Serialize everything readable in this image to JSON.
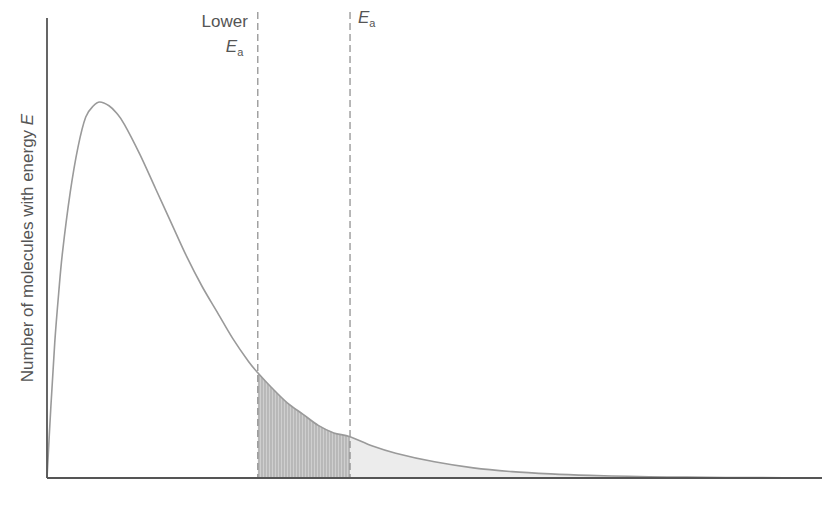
{
  "chart_data": {
    "type": "area",
    "title": "",
    "xlabel": "",
    "ylabel": "Number of molecules with energy",
    "ylabel_var": "E",
    "xlim": [
      0,
      10
    ],
    "ylim": [
      0,
      1.25
    ],
    "grid": false,
    "legend": "none",
    "series": [
      {
        "name": "energy distribution",
        "color": "#9a9a9a",
        "x": [
          0,
          0.05,
          0.1,
          0.15,
          0.2,
          0.3,
          0.4,
          0.5,
          0.6,
          0.68,
          0.8,
          0.9,
          1.0,
          1.2,
          1.4,
          1.6,
          1.8,
          2.0,
          2.2,
          2.4,
          2.6,
          2.72,
          2.9,
          3.1,
          3.3,
          3.5,
          3.7,
          3.91,
          4.2,
          4.5,
          5.0,
          5.5,
          6.0,
          6.5,
          7.0,
          7.5,
          8.0,
          8.5,
          9.0,
          9.5,
          9.85
        ],
        "y": [
          0,
          0.19,
          0.36,
          0.49,
          0.6,
          0.76,
          0.88,
          0.96,
          0.99,
          1.0,
          0.99,
          0.97,
          0.94,
          0.86,
          0.77,
          0.68,
          0.59,
          0.51,
          0.44,
          0.37,
          0.31,
          0.28,
          0.24,
          0.2,
          0.17,
          0.14,
          0.12,
          0.11,
          0.085,
          0.066,
          0.043,
          0.027,
          0.017,
          0.011,
          0.007,
          0.0045,
          0.0028,
          0.0018,
          0.0011,
          0.0007,
          0.0005
        ]
      }
    ],
    "annotations": [
      {
        "id": "lower-ea",
        "x": 2.72,
        "line1": "Lower",
        "var": "E",
        "sub": "a",
        "style": "dashed"
      },
      {
        "id": "ea",
        "x": 3.91,
        "line1": "",
        "var": "E",
        "sub": "a",
        "style": "dashed"
      }
    ],
    "shaded_regions": [
      {
        "name": "extra molecules above lower Ea",
        "from": 2.72,
        "to": 3.91,
        "fill": "#c8c8c8",
        "pattern": "vertical-hatch"
      },
      {
        "name": "molecules above Ea",
        "from": 3.91,
        "to": 9.85,
        "fill": "#ececec"
      }
    ]
  }
}
